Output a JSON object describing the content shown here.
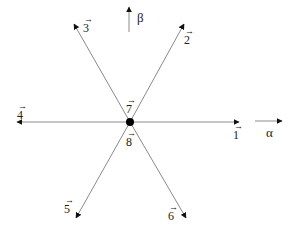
{
  "diagram": {
    "title": "",
    "axes": {
      "alpha": {
        "label": "α",
        "direction": "right"
      },
      "beta": {
        "label": "β",
        "direction": "up"
      }
    },
    "origin": {
      "label_top": "7",
      "label_bottom": "8"
    },
    "vectors": [
      {
        "id": "1",
        "label": "1",
        "angle_deg": 0
      },
      {
        "id": "2",
        "label": "2",
        "angle_deg": 60
      },
      {
        "id": "3",
        "label": "3",
        "angle_deg": 120
      },
      {
        "id": "4",
        "label": "4",
        "angle_deg": 180
      },
      {
        "id": "5",
        "label": "5",
        "angle_deg": 240
      },
      {
        "id": "6",
        "label": "6",
        "angle_deg": 300
      },
      {
        "id": "7",
        "label": "7",
        "angle_deg": null
      },
      {
        "id": "8",
        "label": "8",
        "angle_deg": null
      }
    ],
    "colors": {
      "line": "#8a8a8a",
      "arrowhead": "#111111",
      "dot": "#000000",
      "text": "#222222"
    }
  }
}
